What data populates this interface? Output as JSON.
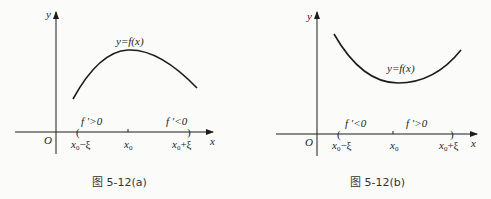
{
  "figures": [
    {
      "id": "a",
      "caption": "图 5-12(a)",
      "y_axis_label": "y",
      "x_axis_label": "x",
      "origin_label": "O",
      "curve_label": "y=f(x)",
      "curve_shape": "concave-down, maximum at x0",
      "left_interval_label": "f ′>0",
      "right_interval_label": "f ′<0",
      "tick_labels": {
        "left": {
          "base": "x",
          "sub": "0",
          "suffix": "−ξ"
        },
        "center": {
          "base": "x",
          "sub": "0",
          "suffix": ""
        },
        "right": {
          "base": "x",
          "sub": "0",
          "suffix": "+ξ"
        }
      },
      "bracket_left": "(",
      "bracket_right": ")"
    },
    {
      "id": "b",
      "caption": "图 5-12(b)",
      "y_axis_label": "y",
      "x_axis_label": "x",
      "origin_label": "O",
      "curve_label": "y=f(x)",
      "curve_shape": "concave-up, minimum at x0",
      "left_interval_label": "f ′<0",
      "right_interval_label": "f ′>0",
      "tick_labels": {
        "left": {
          "base": "x",
          "sub": "0",
          "suffix": "−ξ"
        },
        "center": {
          "base": "x",
          "sub": "0",
          "suffix": ""
        },
        "right": {
          "base": "x",
          "sub": "0",
          "suffix": "+ξ"
        }
      },
      "bracket_left": "(",
      "bracket_right": ")"
    }
  ]
}
